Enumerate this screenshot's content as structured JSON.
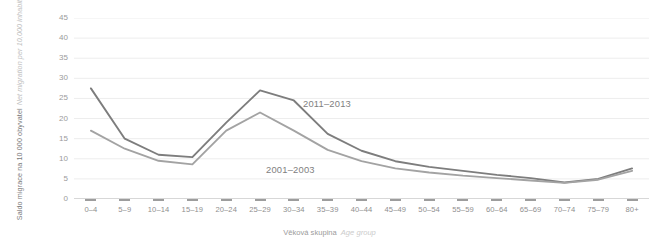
{
  "axes": {
    "y_title_cz": "Saldo migrace na 10 000 obyvatel",
    "y_title_en": "Net migration per 10,000 inhabitants",
    "x_title_cz": "Věková skupina",
    "x_title_en": "Age group"
  },
  "annotations": {
    "series_new": "2011–2013",
    "series_old": "2001–2003"
  },
  "colors": {
    "series_new": "#7d7d7d",
    "series_old": "#a3a3a3",
    "grid": "#ededed",
    "axis": "#c9c9c9",
    "tick_text": "#9b9b9b",
    "background": "#ffffff"
  },
  "chart_data": {
    "type": "line",
    "title": "",
    "xlabel": "Věková skupina / Age group",
    "ylabel": "Saldo migrace na 10 000 obyvatel / Net migration per 10,000 inhabitants",
    "categories": [
      "0–4",
      "5–9",
      "10–14",
      "15–19",
      "20–24",
      "25–29",
      "30–34",
      "35–39",
      "40–44",
      "45–49",
      "50–54",
      "55–59",
      "60–64",
      "65–69",
      "70–74",
      "75–79",
      "80+"
    ],
    "yticks": [
      0,
      5,
      10,
      15,
      20,
      25,
      30,
      35,
      40,
      45
    ],
    "ylim": [
      0,
      45
    ],
    "grid": true,
    "legend": "inline-annotations",
    "series": [
      {
        "name": "2011–2013",
        "color": "#7d7d7d",
        "values": [
          27.5,
          15.0,
          11.0,
          10.4,
          19.0,
          27.0,
          24.5,
          16.2,
          12.0,
          9.4,
          8.0,
          7.0,
          6.0,
          5.2,
          4.1,
          5.0,
          7.6
        ]
      },
      {
        "name": "2001–2003",
        "color": "#a3a3a3",
        "values": [
          17.0,
          12.5,
          9.5,
          8.6,
          17.0,
          21.5,
          17.0,
          12.2,
          9.4,
          7.6,
          6.6,
          5.8,
          5.2,
          4.6,
          4.0,
          4.8,
          7.0
        ]
      }
    ]
  }
}
